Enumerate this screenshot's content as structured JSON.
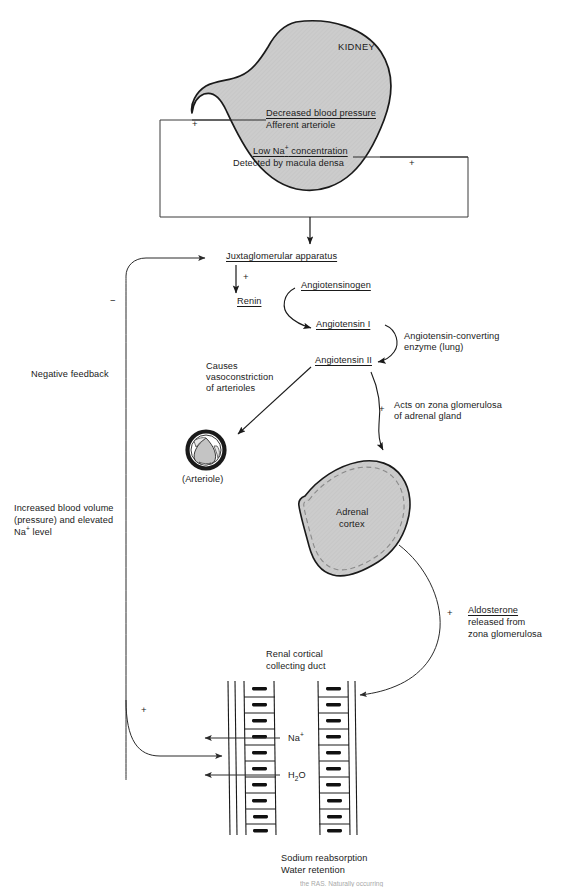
{
  "figure": {
    "organ_label": "KIDNEY"
  },
  "kidney_box": {
    "stimulus_1": {
      "line1": "Decreased blood pressure",
      "line2": "Afferent arteriole",
      "sign": "+"
    },
    "stimulus_2": {
      "line1_pre": "Low Na",
      "line1_sup": "+",
      "line1_post": " concentration",
      "line2": "Detected by macula densa",
      "sign": "+"
    }
  },
  "cascade": {
    "juxtaglomerular": "Juxtaglomerular apparatus",
    "juxtaglomerular_sign": "+",
    "renin": "Renin",
    "angiotensinogen": "Angiotensinogen",
    "angiotensin_i": "Angiotensin I",
    "ace_line1": "Angiotensin-converting",
    "ace_line2": "enzyme (lung)",
    "angiotensin_ii": "Angiotensin II",
    "vasoconstriction_line1": "Causes",
    "vasoconstriction_line2": "vasoconstriction",
    "vasoconstriction_line3": "of arterioles",
    "arteriole_label": "(Arteriole)",
    "zona_sign": "+",
    "zona_line1": "Acts on zona glomerulosa",
    "zona_line2": "of adrenal gland"
  },
  "adrenal": {
    "line1": "Adrenal",
    "line2": "cortex"
  },
  "aldosterone": {
    "sign": "+",
    "line1": "Aldosterone",
    "line2": "released from",
    "line3": "zona glomerulosa"
  },
  "duct": {
    "title_line1": "Renal cortical",
    "title_line2": "collecting duct",
    "na_label_pre": "Na",
    "na_label_sup": "+",
    "water_label_pre": "H",
    "water_label_sub": "2",
    "water_label_post": "O",
    "feedback_sign": "+",
    "outcome_line1": "Sodium reabsorption",
    "outcome_line2": "Water retention"
  },
  "feedback": {
    "negative_sign": "−",
    "negative_label": "Negative feedback",
    "result_line1": "Increased blood volume",
    "result_line2_pre": "(pressure) and elevated",
    "result_line3_pre": "Na",
    "result_line3_sup": "+",
    "result_line3_post": " level"
  },
  "footer": {
    "caption": "the RAS. Naturally occurring"
  },
  "colors": {
    "organ_fill": "#c9c9c9",
    "organ_stroke": "#1a1a1a",
    "line": "#1a1a1a",
    "thin_line": "#4a4a4a",
    "text": "#1a1a1a",
    "background": "#ffffff"
  }
}
